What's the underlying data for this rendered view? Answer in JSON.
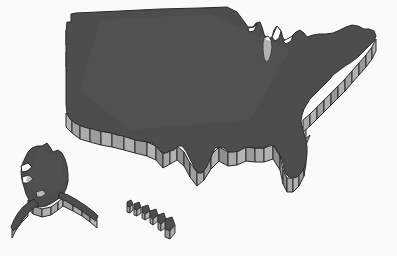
{
  "figure": {
    "kind": "map",
    "background_color": "#fbfbfa",
    "canvas": {
      "width": 397,
      "height": 256
    }
  },
  "style": {
    "top_face_color": "#4d4d4d",
    "top_face_color_alt": "#565656",
    "side_face_color": "#9a9a9a",
    "side_face_color_dark": "#7c7c7c",
    "side_face_color_light": "#b4b4b4",
    "outline_color": "#2b2b2b",
    "outline_width": 1,
    "extrusion_direction": "down",
    "extrusion_depth_px": 14,
    "lake_fill_color": "#fbfbfa"
  },
  "regions": [
    {
      "id": "continental-us",
      "name": "Contiguous United States",
      "label": "",
      "top_path": "M 69 116 L 67 100 L 66 84 L 66 66 L 66 50 L 67 31 L 67 22 L 70 22 L 70 14 L 73 13 L 104 11 L 140 9 L 175 8 L 210 7 L 228 7 L 237 12 L 243 20 L 247 27 L 252 28 L 255 24 L 259 22 L 262 26 L 264 33 L 266 39 L 271 37 L 273 30 L 276 26 L 280 30 L 282 37 L 285 40 L 290 37 L 295 32 L 299 30 L 303 32 L 306 36 L 312 35 L 318 33 L 324 33 L 330 33 L 336 31 L 341 29 L 345 26 L 350 24 L 355 25 L 360 27 L 364 29 L 368 28 L 371 30 L 373 34 L 371 38 L 368 41 L 366 45 L 364 49 L 361 52 L 358 55 L 354 57 L 350 59 L 347 62 L 344 65 L 341 69 L 337 72 L 333 74 L 330 77 L 327 80 L 324 83 L 321 86 L 318 89 L 315 92 L 312 95 L 309 99 L 306 103 L 303 107 L 300 111 L 298 116 L 297 122 L 298 128 L 300 133 L 303 137 L 305 142 L 306 148 L 306 154 L 305 160 L 303 166 L 300 171 L 297 175 L 293 178 L 289 179 L 285 177 L 283 173 L 282 168 L 281 162 L 280 156 L 278 151 L 275 147 L 271 145 L 267 146 L 263 148 L 259 149 L 255 148 L 251 147 L 247 146 L 243 147 L 239 149 L 236 152 L 232 153 L 228 152 L 225 149 L 222 146 L 219 144 L 215 144 L 212 146 L 209 150 L 207 155 L 205 160 L 203 165 L 200 169 L 197 172 L 194 174 L 191 173 L 189 169 L 188 164 L 187 158 L 186 152 L 184 147 L 181 143 L 178 140 L 174 139 L 170 140 L 166 142 L 162 144 L 158 145 L 154 144 L 150 142 L 146 140 L 142 139 L 138 138 L 134 137 L 130 136 L 126 135 L 122 134 L 118 133 L 114 132 L 110 131 L 106 130 L 102 129 L 98 128 L 94 127 L 90 126 L 86 125 L 82 124 L 78 122 L 74 120 Z",
      "centroid": [
        200,
        80
      ]
    },
    {
      "id": "alaska",
      "name": "Alaska",
      "label": "",
      "centroid": [
        55,
        195
      ]
    },
    {
      "id": "hawaii",
      "name": "Hawaii",
      "label": "",
      "centroid": [
        148,
        215
      ]
    },
    {
      "id": "lake-michigan",
      "name": "Lake Michigan",
      "label": "",
      "centroid": [
        268,
        55
      ]
    }
  ],
  "annotations": [],
  "legend": {
    "visible": false,
    "entries": []
  }
}
